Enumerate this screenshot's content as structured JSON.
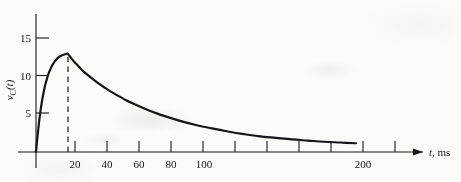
{
  "figure": {
    "name": "capacitor-voltage-transient-plot",
    "background_color": "#fbfbf9",
    "ink_color": "#16161a"
  },
  "chart_data": {
    "type": "line",
    "title": "",
    "subtitle": "",
    "xlabel": "t, ms",
    "xlabel_symbol": "t",
    "xlabel_unit": ", ms",
    "ylabel": "vC(t)",
    "ylabel_symbol": "v",
    "ylabel_subscript": "C",
    "ylabel_argument": "(t)",
    "xlim": [
      0,
      240
    ],
    "ylim": [
      0,
      17
    ],
    "grid": false,
    "legend": "none",
    "x_ticks": [
      20,
      40,
      60,
      80,
      100,
      120,
      140,
      160,
      180,
      200,
      220
    ],
    "x_tick_labels": [
      "20",
      "40",
      "60",
      "80",
      "100",
      "",
      "",
      "",
      "",
      "200",
      ""
    ],
    "y_ticks": [
      5,
      10,
      15
    ],
    "y_tick_labels": [
      "5",
      "10",
      "15"
    ],
    "annotations": [
      {
        "name": "peak-dashed-line",
        "kind": "vertical-dashed-line",
        "x": 20,
        "y_from": 0,
        "y_to": 12.9,
        "label": ""
      }
    ],
    "series": [
      {
        "name": "vC(t)",
        "peak_x": 20,
        "peak_y": 12.9,
        "x": [
          0,
          1,
          2,
          3,
          4,
          5,
          6,
          7,
          8,
          9,
          10,
          11,
          12,
          13,
          14,
          15,
          16,
          17,
          18,
          19,
          20,
          22,
          24,
          26,
          28,
          30,
          34,
          38,
          42,
          46,
          50,
          56,
          62,
          68,
          74,
          80,
          90,
          100,
          110,
          120,
          130,
          140,
          150,
          160,
          170,
          180,
          190,
          200
        ],
        "y": [
          0.0,
          2.2,
          4.1,
          5.7,
          7.0,
          8.1,
          9.0,
          9.75,
          10.4,
          10.9,
          11.35,
          11.7,
          12.0,
          12.25,
          12.45,
          12.6,
          12.7,
          12.8,
          12.85,
          12.9,
          12.9,
          12.35,
          11.85,
          11.4,
          10.95,
          10.55,
          9.85,
          9.2,
          8.6,
          8.05,
          7.55,
          6.85,
          6.25,
          5.7,
          5.2,
          4.75,
          4.1,
          3.55,
          3.1,
          2.7,
          2.35,
          2.05,
          1.85,
          1.65,
          1.5,
          1.35,
          1.25,
          1.15
        ]
      }
    ]
  },
  "axes": {
    "x_axis_name": "time-axis",
    "y_axis_name": "voltage-axis",
    "x_axis_has_arrow": true,
    "y_axis_has_arrow": false
  }
}
